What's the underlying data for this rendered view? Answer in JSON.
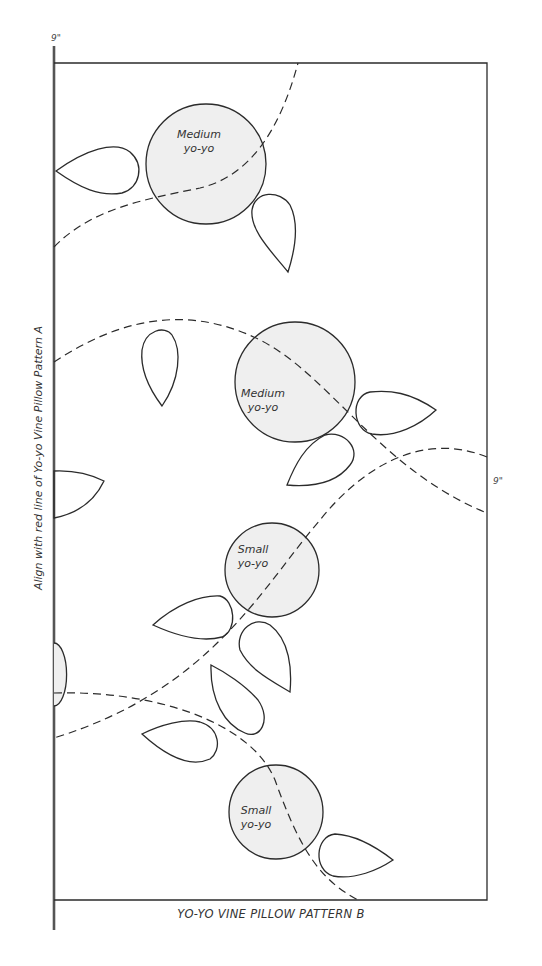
{
  "pattern": {
    "title": "YO-YO VINE PILLOW PATTERN B",
    "side_instruction": "Align with red line of Yo-yo Vine Pillow Pattern A",
    "dimension_top": "9\"",
    "dimension_right": "9\"",
    "yoyos": [
      {
        "id": "medium-1",
        "size": "Medium",
        "line1": "Medium",
        "line2": "yo-yo"
      },
      {
        "id": "medium-2",
        "size": "Medium",
        "line1": "Medium",
        "line2": "yo-yo"
      },
      {
        "id": "small-1",
        "size": "Small",
        "line1": "Small",
        "line2": "yo-yo"
      },
      {
        "id": "small-2",
        "size": "Small",
        "line1": "Small",
        "line2": "yo-yo"
      }
    ],
    "colors": {
      "line": "#2b2b2b",
      "yoyo_fill": "#efefef",
      "background": "#ffffff"
    }
  }
}
